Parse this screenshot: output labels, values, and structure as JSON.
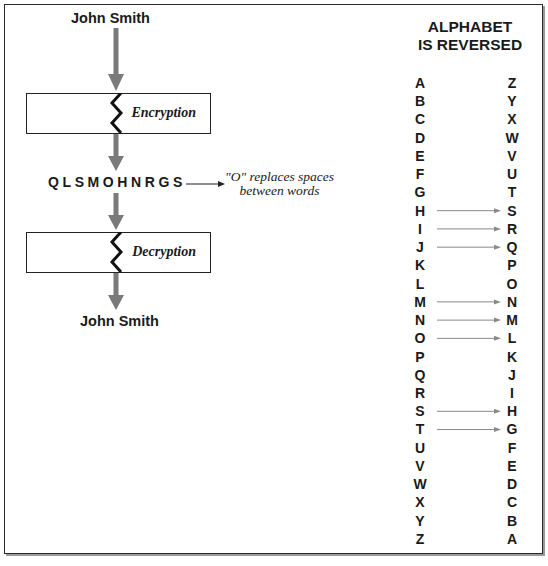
{
  "flow": {
    "plaintext_top": "John Smith",
    "encryption_label": "Encryption",
    "ciphertext": "QLSMOHNRGS",
    "note_line1": "\"O\" replaces spaces",
    "note_line2": "between words",
    "decryption_label": "Decryption",
    "plaintext_bottom": "John Smith"
  },
  "cipher_table": {
    "heading_line1": "ALPHABET",
    "heading_line2": "IS REVERSED",
    "left": [
      "A",
      "B",
      "C",
      "D",
      "E",
      "F",
      "G",
      "H",
      "I",
      "J",
      "K",
      "L",
      "M",
      "N",
      "O",
      "P",
      "Q",
      "R",
      "S",
      "T",
      "U",
      "V",
      "W",
      "X",
      "Y",
      "Z"
    ],
    "right": [
      "Z",
      "Y",
      "X",
      "W",
      "V",
      "U",
      "T",
      "S",
      "R",
      "Q",
      "P",
      "O",
      "N",
      "M",
      "L",
      "K",
      "J",
      "I",
      "H",
      "G",
      "F",
      "E",
      "D",
      "C",
      "B",
      "A"
    ],
    "highlighted_mappings": [
      "H",
      "I",
      "J",
      "M",
      "N",
      "O",
      "S",
      "T"
    ]
  },
  "colors": {
    "arrow_gray": "#7a7a7a",
    "thin_arrow_gray": "#8a8a8a",
    "text": "#1a1a1a",
    "border": "#2a2a2a"
  }
}
